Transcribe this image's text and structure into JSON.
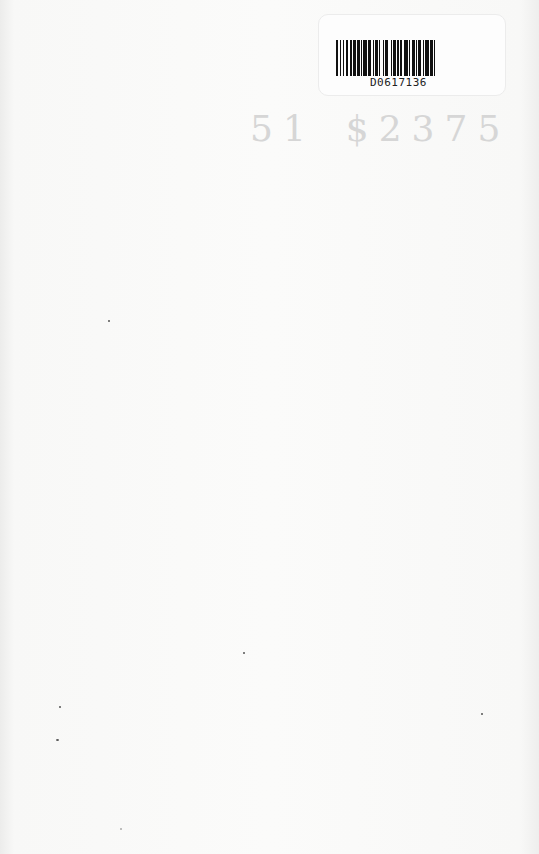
{
  "document": {
    "type": "scanned book endpaper",
    "background_color": "#f8f8f7"
  },
  "barcode_label": {
    "barcode_number": "D0617136"
  },
  "price_stamp": {
    "code": "51",
    "price": "$2375",
    "color": "#d6d6d6"
  }
}
